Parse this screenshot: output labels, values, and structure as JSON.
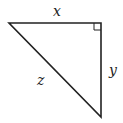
{
  "diagram": {
    "type": "right-triangle",
    "labels": {
      "top_side": "x",
      "right_side": "y",
      "hypotenuse": "z"
    },
    "right_angle_marker": true,
    "stroke_color": "#222222"
  }
}
